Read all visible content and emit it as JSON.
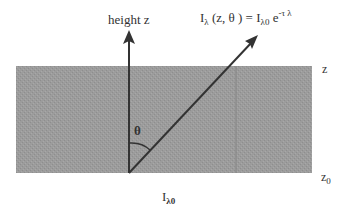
{
  "diagram": {
    "layer": {
      "fill_color": "#9a9a9a",
      "top_boundary_label": "z",
      "bottom_boundary_label_base": "z",
      "bottom_boundary_label_sub": "0"
    },
    "vertical_axis": {
      "label": "height z"
    },
    "ray": {
      "angle_label": "θ"
    },
    "equation": {
      "lhs_I": "I",
      "lhs_sub": "λ",
      "lhs_args": " (z, θ ) = ",
      "rhs_I": "I",
      "rhs_sub": "λ0",
      "rhs_e": " e",
      "rhs_sup": "-τ λ"
    },
    "incident_intensity": {
      "base": "I",
      "sub": "λ0"
    },
    "colors": {
      "stroke": "#333333",
      "layer": "#9a9a9a",
      "background": "#ffffff"
    }
  }
}
